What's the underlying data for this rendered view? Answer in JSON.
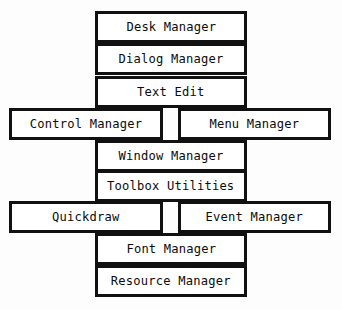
{
  "diagram": {
    "type": "layered-block-diagram",
    "background_color": "#fdfdfd",
    "box_fill_color": "#ffffff",
    "box_border_color": "#111111",
    "text_color": "#0b0b0b",
    "rows": [
      {
        "index": 0,
        "top": 13,
        "nodes": [
          {
            "label": "Desk Manager",
            "placement": "center"
          }
        ]
      },
      {
        "index": 1,
        "top": 45,
        "nodes": [
          {
            "label": "Dialog Manager",
            "placement": "center"
          }
        ]
      },
      {
        "index": 2,
        "top": 78,
        "nodes": [
          {
            "label": "Text Edit",
            "placement": "center"
          }
        ]
      },
      {
        "index": 3,
        "top": 110,
        "nodes": [
          {
            "label": "Control Manager",
            "placement": "left"
          },
          {
            "label": "Menu Manager",
            "placement": "right"
          }
        ]
      },
      {
        "index": 4,
        "top": 142,
        "nodes": [
          {
            "label": "Window Manager",
            "placement": "center"
          }
        ]
      },
      {
        "index": 5,
        "top": 172,
        "nodes": [
          {
            "label": "Toolbox Utilities",
            "placement": "center"
          }
        ]
      },
      {
        "index": 6,
        "top": 203,
        "nodes": [
          {
            "label": "Quickdraw",
            "placement": "left"
          },
          {
            "label": "Event Manager",
            "placement": "right"
          }
        ]
      },
      {
        "index": 7,
        "top": 235,
        "nodes": [
          {
            "label": "Font Manager",
            "placement": "center"
          }
        ]
      },
      {
        "index": 8,
        "top": 267,
        "nodes": [
          {
            "label": "Resource Manager",
            "placement": "center"
          }
        ]
      }
    ]
  }
}
